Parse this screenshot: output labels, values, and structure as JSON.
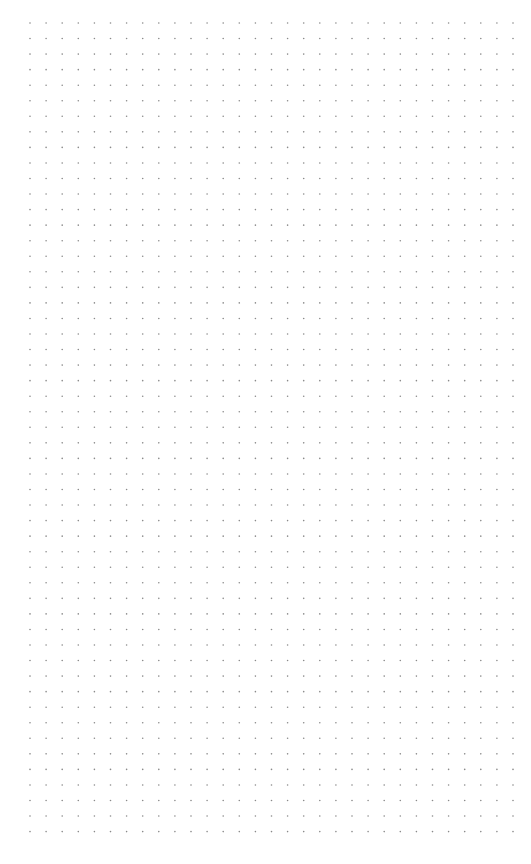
{
  "page": {
    "background_color": "#ffffff",
    "width": 531,
    "height": 864
  },
  "dot_grid": {
    "dot_color": "#8a8a8a",
    "dot_radius": 0.8,
    "origin_x": 30,
    "origin_y": 23,
    "spacing_x": 16.1,
    "spacing_y": 15.55,
    "columns": 31,
    "rows": 53
  }
}
